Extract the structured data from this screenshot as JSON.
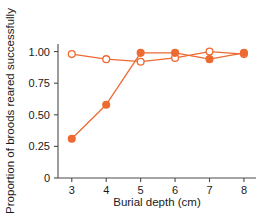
{
  "chart_data": {
    "type": "line",
    "title": "",
    "xlabel": "Burial depth (cm)",
    "ylabel": "Proportion of broods reared successfully",
    "x": [
      3,
      4,
      5,
      6,
      7,
      8
    ],
    "xtick_labels": [
      "3",
      "4",
      "5",
      "6",
      "7",
      "8"
    ],
    "ytick_labels": [
      "0",
      "0.25",
      "0.50",
      "0.75",
      "1.00"
    ],
    "ytick_values": [
      0,
      0.25,
      0.5,
      0.75,
      1.0
    ],
    "xlim": [
      2.6,
      8.35
    ],
    "ylim": [
      0,
      1.06
    ],
    "grid": false,
    "legend": "none",
    "series": [
      {
        "name": "open-circles",
        "marker": "open-circle",
        "color": "#ED6A32",
        "values": [
          0.98,
          0.94,
          0.92,
          0.95,
          1.0,
          0.98
        ]
      },
      {
        "name": "filled-circles",
        "marker": "filled-circle",
        "color": "#ED6A32",
        "values": [
          0.31,
          0.58,
          0.99,
          0.99,
          0.94,
          0.99
        ]
      }
    ]
  },
  "colors": {
    "accent": "#ED6A32",
    "axis": "#4a4a4a",
    "text": "#1a1a1a",
    "background": "#ffffff"
  }
}
